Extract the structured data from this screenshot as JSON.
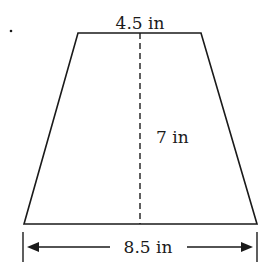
{
  "figure": {
    "shape": "trapezoid",
    "bullet": ".",
    "top_base_label": "4.5 in",
    "height_label": "7 in",
    "bottom_base_label": "8.5 in",
    "colors": {
      "stroke": "#1a1a1a",
      "background": "#ffffff"
    }
  }
}
